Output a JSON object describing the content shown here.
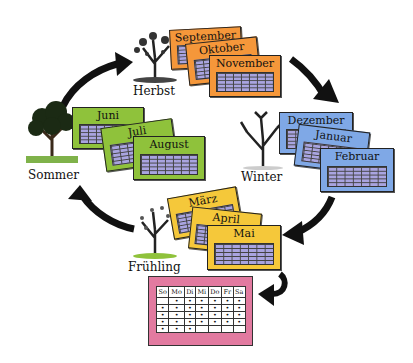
{
  "seasons": {
    "herbst": {
      "label": "Herbst",
      "months": [
        "September",
        "Oktober",
        "November"
      ],
      "color": "#f5973a"
    },
    "winter": {
      "label": "Winter",
      "months": [
        "Dezember",
        "Januar",
        "Februar"
      ],
      "color": "#7fa8e6"
    },
    "fruehling": {
      "label": "Frühling",
      "months": [
        "März",
        "April",
        "Mai"
      ],
      "color": "#f5c83a"
    },
    "sommer": {
      "label": "Sommer",
      "months": [
        "Juni",
        "Juli",
        "August"
      ],
      "color": "#8fc23b"
    }
  },
  "week_calendar": {
    "color": "#e27aa0",
    "days": [
      "So",
      "Mo",
      "Di",
      "Mi",
      "Do",
      "Fr",
      "Sa"
    ],
    "rows": [
      [
        "",
        "•",
        "•",
        "•",
        "•",
        "•",
        "•"
      ],
      [
        "•",
        "•",
        "•",
        "•",
        "•",
        "•",
        "•"
      ],
      [
        "•",
        "•",
        "•",
        "•",
        "•",
        "•",
        "•"
      ],
      [
        "•",
        "•",
        "•",
        "•",
        "•",
        "•",
        "•"
      ],
      [
        "•",
        "•",
        "•",
        "",
        "",
        "",
        ""
      ]
    ]
  },
  "cycle_order": [
    "Herbst",
    "Winter",
    "Frühling",
    "Sommer"
  ]
}
